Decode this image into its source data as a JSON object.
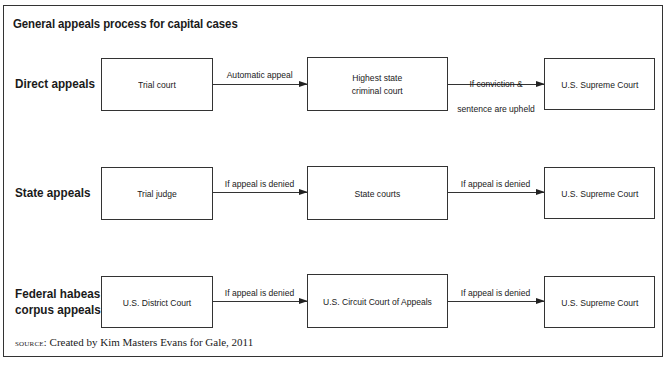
{
  "title": "General appeals process for capital cases",
  "rows": [
    {
      "label": "Direct appeals",
      "boxes": [
        "Trial court",
        "Highest state\ncriminal court",
        "U.S. Supreme Court"
      ],
      "arrows": [
        "Automatic appeal",
        "If conviction &\nsentence are upheld"
      ]
    },
    {
      "label": "State appeals",
      "boxes": [
        "Trial judge",
        "State courts",
        "U.S. Supreme Court"
      ],
      "arrows": [
        "If appeal is denied",
        "If appeal is denied"
      ]
    },
    {
      "label": "Federal habeas\ncorpus appeals",
      "boxes": [
        "U.S. District Court",
        "U.S. Circuit Court of Appeals",
        "U.S. Supreme Court"
      ],
      "arrows": [
        "If appeal is denied",
        "If appeal is denied"
      ]
    }
  ],
  "source": {
    "prefix": "source:",
    "text": " Created by Kim Masters Evans for Gale, 2011"
  }
}
